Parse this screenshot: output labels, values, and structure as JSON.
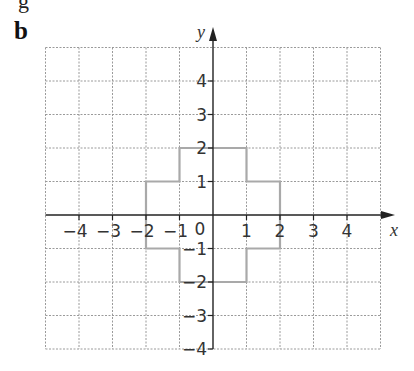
{
  "panel_label": "b",
  "partial_text_top": "g",
  "axes": {
    "x_label": "x",
    "y_label": "y",
    "origin_label": "0",
    "x_ticks": [
      "-4",
      "-3",
      "-2",
      "-1",
      "1",
      "2",
      "3",
      "4"
    ],
    "y_ticks": [
      "4",
      "3",
      "2",
      "1",
      "-1",
      "-2",
      "-3",
      "-4"
    ],
    "x_range": [
      -5,
      5
    ],
    "y_range": [
      -4,
      5
    ]
  },
  "shape": {
    "description": "Cross-shaped polygon",
    "vertices": [
      [
        0,
        2
      ],
      [
        1,
        2
      ],
      [
        1,
        1
      ],
      [
        2,
        1
      ],
      [
        2,
        -1
      ],
      [
        1,
        -1
      ],
      [
        1,
        -2
      ],
      [
        -1,
        -2
      ],
      [
        -1,
        -1
      ],
      [
        -2,
        -1
      ],
      [
        -2,
        1
      ],
      [
        -1,
        1
      ],
      [
        -1,
        2
      ],
      [
        0,
        2
      ]
    ],
    "stroke_color": "#a9a9a9"
  },
  "colors": {
    "grid": "#9a9a9a",
    "axis": "#222222",
    "text": "#333333"
  }
}
